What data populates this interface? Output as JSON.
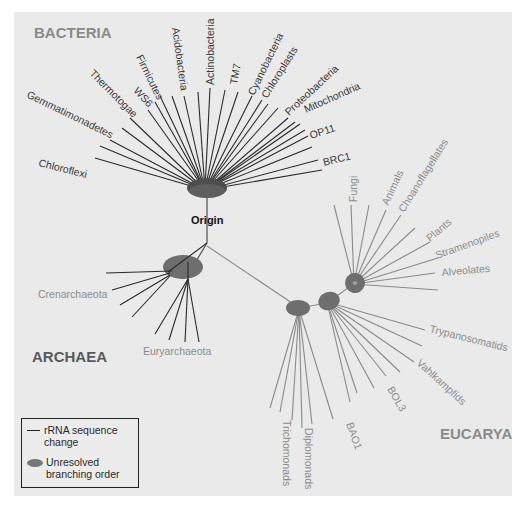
{
  "figure": {
    "domains": {
      "bacteria": "BACTERIA",
      "archaea": "ARCHAEA",
      "eucarya": "EUCARYA"
    },
    "origin_label": "Origin",
    "bacteria_taxa": [
      "Chloroflexi",
      "Gemmatimonadetes",
      "Thermotogae",
      "WS6",
      "Firmicutes",
      "Acidobacteria",
      "Actinobacteria",
      "TM7",
      "Cyanobacteria",
      "Chloroplasts",
      "Proteobacteria",
      "Mitochondria",
      "OP11",
      "BRC1"
    ],
    "archaea_taxa": [
      "Crenarchaeota",
      "Euryarchaeota"
    ],
    "eucarya_taxa": [
      "Fungi",
      "Animals",
      "Choanoflagellates",
      "Plants",
      "Stramenopiles",
      "Alveolates",
      "Trypanosomatids",
      "Vahlkampfids",
      "BOL3",
      "BAO1",
      "Diplomonads",
      "Trichomonads"
    ],
    "colors": {
      "background": "#eaeaea",
      "bacteria_branch": "#2a2a2a",
      "archaea_branch": "#2a2a2a",
      "eucarya_branch": "#8a8a8a",
      "node_fill": "#6e6e6e",
      "domain_label": "#8a8a8a"
    }
  },
  "legend": {
    "line_label_1": "rRNA sequence",
    "line_label_2": "change",
    "ellipse_label_1": "Unresolved",
    "ellipse_label_2": "branching order"
  }
}
